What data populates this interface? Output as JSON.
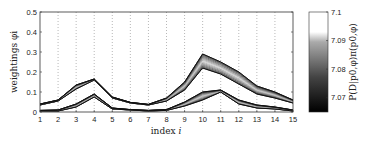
{
  "chart_data": {
    "type": "line",
    "title": "",
    "xlabel": "index i",
    "ylabel": "weightings φi",
    "xlim": [
      1,
      15
    ],
    "ylim": [
      0,
      0.5
    ],
    "x_ticks": [
      1,
      2,
      3,
      4,
      5,
      6,
      7,
      8,
      9,
      10,
      11,
      12,
      13,
      14,
      15
    ],
    "y_ticks": [
      0,
      0.1,
      0.2,
      0.3,
      0.4,
      0.5
    ],
    "y_tick_labels": [
      "0",
      "0.1",
      "0.2",
      "0.3",
      "0.4",
      "0.5"
    ],
    "grid": "vertical dotted lines at integer indices",
    "x": [
      1,
      2,
      3,
      4,
      5,
      6,
      7,
      8,
      9,
      10,
      11,
      12,
      13,
      14,
      15
    ],
    "series": [
      {
        "name": "upper band (low end, P=7.065)",
        "values": [
          0.035,
          0.055,
          0.115,
          0.16,
          0.07,
          0.045,
          0.035,
          0.055,
          0.11,
          0.22,
          0.19,
          0.14,
          0.09,
          0.07,
          0.045
        ]
      },
      {
        "name": "upper band (high end, P=7.1)",
        "values": [
          0.04,
          0.06,
          0.135,
          0.165,
          0.075,
          0.048,
          0.038,
          0.07,
          0.15,
          0.29,
          0.25,
          0.2,
          0.13,
          0.1,
          0.06
        ]
      },
      {
        "name": "lower band (low end, P=7.065)",
        "values": [
          0.005,
          0.005,
          0.025,
          0.075,
          0.015,
          0.01,
          0.005,
          0.008,
          0.03,
          0.06,
          0.1,
          0.04,
          0.02,
          0.015,
          0.005
        ]
      },
      {
        "name": "lower band (high end, P=7.1)",
        "values": [
          0.008,
          0.01,
          0.04,
          0.09,
          0.02,
          0.012,
          0.008,
          0.012,
          0.05,
          0.1,
          0.11,
          0.06,
          0.035,
          0.025,
          0.01
        ]
      }
    ],
    "colorbar": {
      "label": "P(D|p0,φ)π(p0,φ)",
      "range": [
        7.065,
        7.1
      ],
      "ticks": [
        7.07,
        7.08,
        7.09,
        7.1
      ],
      "tick_labels": [
        "7.07",
        "7.08",
        "7.09",
        "7.1"
      ],
      "colormap": "gray (black low, white high)"
    },
    "legend": null
  },
  "axes": {
    "xlabel_main": "index ",
    "xlabel_var": "i",
    "ylabel": "weightings φi",
    "colorbar_label": "P(D|p0,φ)π(p0,φ)"
  }
}
